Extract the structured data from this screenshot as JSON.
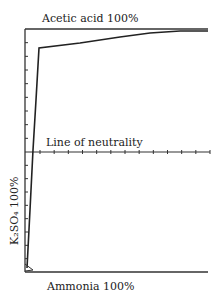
{
  "chart_data": {
    "type": "line",
    "title": "",
    "labels": {
      "top": "Acetic acid 100%",
      "bottom": "Ammonia 100%",
      "middle": "Line of neutrality",
      "left_axis": "K₂SO₄ 100%"
    },
    "xlabel": "",
    "ylabel": "K₂SO₄ 100%",
    "grid": false,
    "legend": null,
    "series": [
      {
        "name": "titration curve",
        "points_px": [
          [
            27,
            268
          ],
          [
            30,
            210
          ],
          [
            33,
            150
          ],
          [
            36,
            100
          ],
          [
            39,
            48
          ],
          [
            80,
            43
          ],
          [
            120,
            37
          ],
          [
            150,
            33
          ],
          [
            180,
            31
          ],
          [
            208,
            31
          ]
        ]
      }
    ],
    "neutrality_line_ticks": 13,
    "left_axis_ticks_upper": 8,
    "left_axis_ticks_lower": 8
  }
}
